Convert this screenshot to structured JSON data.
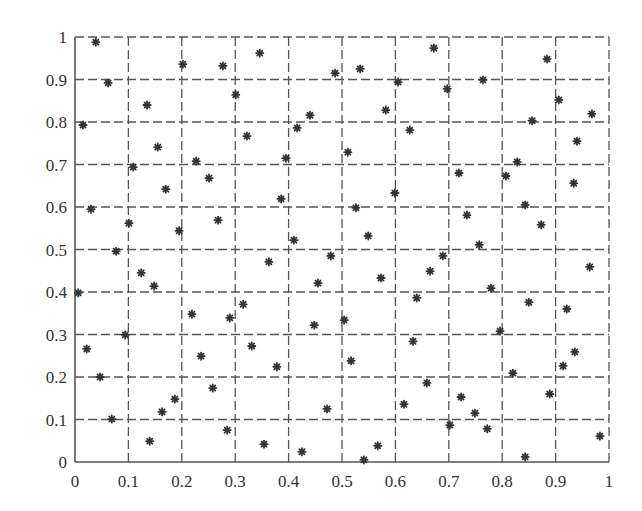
{
  "chart_data": {
    "type": "scatter",
    "title": "",
    "xlabel": "",
    "ylabel": "",
    "xlim": [
      0,
      1
    ],
    "ylim": [
      0,
      1
    ],
    "grid": true,
    "grid_style": "dashed",
    "marker": "*",
    "xticks": [
      "0",
      "0.1",
      "0.2",
      "0.3",
      "0.4",
      "0.5",
      "0.6",
      "0.7",
      "0.8",
      "0.9",
      "1"
    ],
    "yticks": [
      "0",
      "0.1",
      "0.2",
      "0.3",
      "0.4",
      "0.5",
      "0.6",
      "0.7",
      "0.8",
      "0.9",
      "1"
    ],
    "series": [
      {
        "name": "points",
        "color": "#333333",
        "points": [
          [
            0.039,
            0.988
          ],
          [
            0.062,
            0.892
          ],
          [
            0.015,
            0.793
          ],
          [
            0.135,
            0.84
          ],
          [
            0.109,
            0.694
          ],
          [
            0.155,
            0.741
          ],
          [
            0.202,
            0.936
          ],
          [
            0.227,
            0.708
          ],
          [
            0.17,
            0.642
          ],
          [
            0.03,
            0.595
          ],
          [
            0.101,
            0.562
          ],
          [
            0.251,
            0.668
          ],
          [
            0.277,
            0.932
          ],
          [
            0.301,
            0.864
          ],
          [
            0.346,
            0.962
          ],
          [
            0.322,
            0.767
          ],
          [
            0.268,
            0.569
          ],
          [
            0.195,
            0.544
          ],
          [
            0.077,
            0.496
          ],
          [
            0.124,
            0.445
          ],
          [
            0.148,
            0.414
          ],
          [
            0.006,
            0.398
          ],
          [
            0.094,
            0.299
          ],
          [
            0.219,
            0.348
          ],
          [
            0.022,
            0.266
          ],
          [
            0.047,
            0.2
          ],
          [
            0.069,
            0.101
          ],
          [
            0.14,
            0.049
          ],
          [
            0.163,
            0.118
          ],
          [
            0.187,
            0.148
          ],
          [
            0.236,
            0.249
          ],
          [
            0.258,
            0.174
          ],
          [
            0.29,
            0.339
          ],
          [
            0.315,
            0.371
          ],
          [
            0.331,
            0.273
          ],
          [
            0.285,
            0.075
          ],
          [
            0.354,
            0.042
          ],
          [
            0.378,
            0.224
          ],
          [
            0.363,
            0.471
          ],
          [
            0.386,
            0.619
          ],
          [
            0.395,
            0.715
          ],
          [
            0.41,
            0.522
          ],
          [
            0.416,
            0.786
          ],
          [
            0.44,
            0.816
          ],
          [
            0.487,
            0.915
          ],
          [
            0.534,
            0.925
          ],
          [
            0.511,
            0.729
          ],
          [
            0.526,
            0.598
          ],
          [
            0.549,
            0.532
          ],
          [
            0.479,
            0.485
          ],
          [
            0.455,
            0.421
          ],
          [
            0.448,
            0.322
          ],
          [
            0.504,
            0.334
          ],
          [
            0.517,
            0.238
          ],
          [
            0.472,
            0.125
          ],
          [
            0.425,
            0.024
          ],
          [
            0.541,
            0.005
          ],
          [
            0.567,
            0.038
          ],
          [
            0.573,
            0.433
          ],
          [
            0.582,
            0.828
          ],
          [
            0.605,
            0.894
          ],
          [
            0.627,
            0.781
          ],
          [
            0.599,
            0.633
          ],
          [
            0.633,
            0.284
          ],
          [
            0.616,
            0.136
          ],
          [
            0.64,
            0.386
          ],
          [
            0.659,
            0.186
          ],
          [
            0.665,
            0.449
          ],
          [
            0.689,
            0.485
          ],
          [
            0.672,
            0.974
          ],
          [
            0.697,
            0.878
          ],
          [
            0.719,
            0.68
          ],
          [
            0.734,
            0.581
          ],
          [
            0.757,
            0.511
          ],
          [
            0.779,
            0.409
          ],
          [
            0.796,
            0.308
          ],
          [
            0.723,
            0.153
          ],
          [
            0.749,
            0.115
          ],
          [
            0.772,
            0.078
          ],
          [
            0.702,
            0.087
          ],
          [
            0.764,
            0.899
          ],
          [
            0.807,
            0.673
          ],
          [
            0.828,
            0.706
          ],
          [
            0.843,
            0.605
          ],
          [
            0.873,
            0.558
          ],
          [
            0.856,
            0.803
          ],
          [
            0.884,
            0.948
          ],
          [
            0.906,
            0.852
          ],
          [
            0.94,
            0.755
          ],
          [
            0.934,
            0.656
          ],
          [
            0.968,
            0.819
          ],
          [
            0.964,
            0.459
          ],
          [
            0.85,
            0.376
          ],
          [
            0.921,
            0.36
          ],
          [
            0.936,
            0.259
          ],
          [
            0.914,
            0.226
          ],
          [
            0.82,
            0.209
          ],
          [
            0.889,
            0.16
          ],
          [
            0.983,
            0.061
          ],
          [
            0.843,
            0.012
          ]
        ]
      }
    ]
  }
}
